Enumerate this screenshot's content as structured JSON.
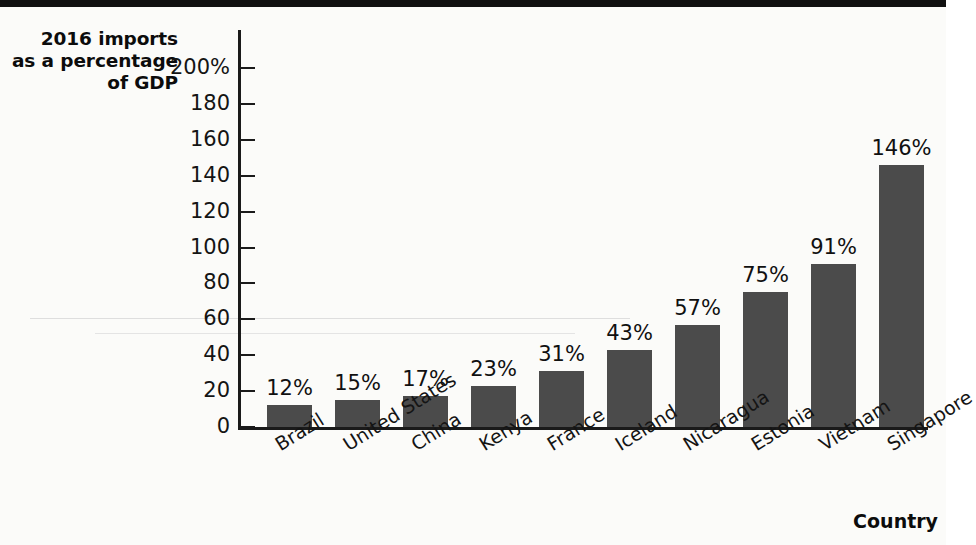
{
  "chart_data": {
    "type": "bar",
    "title": "2016 imports as a percentage of GDP",
    "title_lines": [
      "2016 imports",
      "as a percentage",
      "of GDP"
    ],
    "xlabel": "Country",
    "ylabel": "2016 imports as a percentage of GDP",
    "ylim": [
      0,
      200
    ],
    "grid": false,
    "legend": "none",
    "bar_color": "#4b4b4b",
    "axis_color": "#1a1a1a",
    "ytick_labels": [
      "200%",
      "180",
      "160",
      "140",
      "120",
      "100",
      "80",
      "60",
      "40",
      "20",
      "0"
    ],
    "ytick_values": [
      200,
      180,
      160,
      140,
      120,
      100,
      80,
      60,
      40,
      20,
      0
    ],
    "categories": [
      "Brazil",
      "United States",
      "China",
      "Kenya",
      "France",
      "Iceland",
      "Nicaragua",
      "Estonia",
      "Vietnam",
      "Singapore"
    ],
    "values": [
      12,
      15,
      17,
      23,
      31,
      43,
      57,
      75,
      91,
      146
    ],
    "value_labels": [
      "12%",
      "15%",
      "17%",
      "23%",
      "31%",
      "43%",
      "57%",
      "75%",
      "91%",
      "146%"
    ]
  }
}
